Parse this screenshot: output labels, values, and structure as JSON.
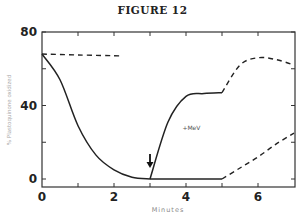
{
  "figure": {
    "title": "FIGURE 12"
  },
  "chart_data": {
    "type": "line",
    "title": "FIGURE 12",
    "xlabel": "Minutes",
    "ylabel": "% Plastoquinone oxidized",
    "xlim": [
      0,
      7
    ],
    "ylim": [
      0,
      80
    ],
    "x_ticks": [
      0,
      2,
      4,
      6
    ],
    "x_minor_ticks": [
      1,
      2,
      3,
      4,
      5,
      6
    ],
    "y_ticks": [
      0,
      40,
      80
    ],
    "y_minor_ticks": [
      20,
      60
    ],
    "grid": false,
    "legend": null,
    "annotations": [
      {
        "text": "+MeV",
        "x": 3.9,
        "y": 28
      },
      {
        "type": "arrow-down",
        "x": 3.0,
        "y": 6
      }
    ],
    "series": [
      {
        "name": "control (dashed, upper)",
        "style": "dashed",
        "x": [
          0,
          1,
          2.2
        ],
        "y": [
          68,
          67.5,
          67
        ]
      },
      {
        "name": "decay (solid)",
        "style": "solid",
        "x": [
          0,
          0.5,
          1.0,
          1.5,
          2.0,
          2.5,
          3.0
        ],
        "y": [
          68,
          54,
          29,
          13,
          5,
          1,
          0
        ]
      },
      {
        "name": "+MeV (solid)",
        "style": "solid",
        "x": [
          3.0,
          3.5,
          4.0,
          4.5,
          5.0
        ],
        "y": [
          0,
          31,
          45,
          46.5,
          47
        ]
      },
      {
        "name": "baseline (solid)",
        "style": "solid",
        "x": [
          3.0,
          4.0,
          5.0
        ],
        "y": [
          0,
          0,
          0
        ]
      },
      {
        "name": "+MeV continuation (dashed)",
        "style": "dashed",
        "x": [
          5.0,
          5.5,
          6.0,
          6.5,
          7.0
        ],
        "y": [
          47,
          62,
          66,
          65,
          62
        ]
      },
      {
        "name": "baseline continuation (dashed)",
        "style": "dashed",
        "x": [
          5.0,
          5.5,
          6.0,
          6.5,
          7.0
        ],
        "y": [
          0,
          6,
          12,
          19,
          25
        ]
      }
    ]
  }
}
